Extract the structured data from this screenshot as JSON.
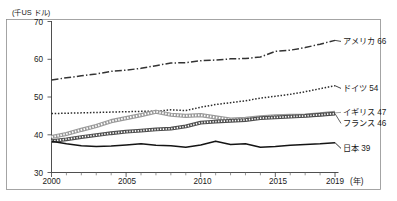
{
  "chart_data": {
    "type": "line",
    "title": "",
    "subtitle": "",
    "unit_label": "(千US ドル)",
    "xlabel": "(年)",
    "ylabel": "",
    "xlim": [
      2000,
      2019
    ],
    "ylim": [
      30,
      70
    ],
    "x_tick_labels": [
      "2000",
      "2005",
      "2010",
      "2015",
      "2019"
    ],
    "x_tick_values": [
      2000,
      2005,
      2010,
      2015,
      2019
    ],
    "x_minor_ticks_every": 1,
    "y_tick_labels": [
      "30",
      "40",
      "50",
      "60",
      "70"
    ],
    "y_tick_values": [
      30,
      40,
      50,
      60,
      70
    ],
    "grid": false,
    "legend_position": "right-inline-end-labels",
    "x": [
      2000,
      2001,
      2002,
      2003,
      2004,
      2005,
      2006,
      2007,
      2008,
      2009,
      2010,
      2011,
      2012,
      2013,
      2014,
      2015,
      2016,
      2017,
      2018,
      2019
    ],
    "series": [
      {
        "name": "アメリカ",
        "end_label": "アメリカ 66",
        "end_value": 66,
        "line_style": "dash-dot",
        "color": "#333333",
        "values": [
          54.5,
          55.1,
          55.6,
          56.1,
          56.8,
          57.1,
          57.6,
          58.3,
          59.0,
          59.1,
          59.6,
          59.8,
          60.1,
          60.2,
          60.6,
          62.1,
          62.4,
          63.1,
          64.0,
          65.0
        ]
      },
      {
        "name": "ドイツ",
        "end_label": "ドイツ 54",
        "end_value": 54,
        "line_style": "dotted",
        "color": "#2b2b2b",
        "values": [
          45.6,
          45.7,
          45.8,
          45.9,
          46.0,
          46.1,
          46.2,
          46.2,
          46.6,
          46.4,
          47.3,
          48.0,
          48.5,
          49.0,
          49.7,
          50.2,
          50.7,
          51.4,
          52.2,
          53.0
        ]
      },
      {
        "name": "イギリス",
        "end_label": "イギリス 47",
        "end_value": 47,
        "line_style": "double-thin",
        "color": "#8a8a8a",
        "values": [
          39.4,
          40.2,
          41.3,
          42.3,
          43.6,
          44.4,
          45.2,
          46.1,
          45.3,
          45.0,
          45.2,
          44.6,
          44.0,
          44.2,
          44.6,
          44.9,
          45.0,
          45.1,
          45.4,
          45.8
        ]
      },
      {
        "name": "フランス",
        "end_label": "フランス 46",
        "end_value": 46,
        "line_style": "hatched-band",
        "color": "#555555",
        "values": [
          38.3,
          38.8,
          39.4,
          39.9,
          40.4,
          40.8,
          41.1,
          41.4,
          41.6,
          42.2,
          43.2,
          43.5,
          43.7,
          43.9,
          44.4,
          44.6,
          44.8,
          45.0,
          45.3,
          45.6
        ]
      },
      {
        "name": "日本",
        "end_label": "日本 39",
        "end_value": 39,
        "line_style": "solid",
        "color": "#141414",
        "values": [
          38.3,
          37.6,
          37.1,
          36.9,
          37.0,
          37.3,
          37.6,
          37.2,
          37.1,
          36.7,
          37.3,
          38.3,
          37.4,
          37.6,
          36.7,
          36.9,
          37.2,
          37.4,
          37.6,
          37.9
        ]
      }
    ]
  }
}
